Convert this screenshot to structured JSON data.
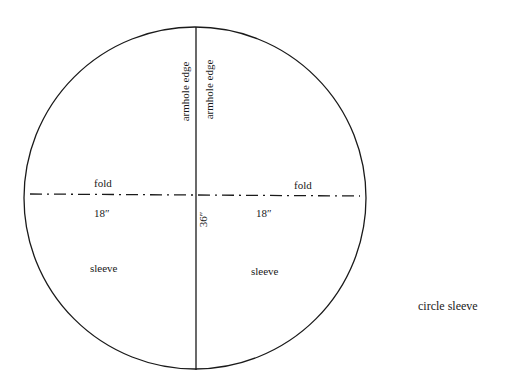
{
  "diagram": {
    "title": "circle sleeve",
    "shape": "circle",
    "circle": {
      "cx": 195,
      "cy": 198,
      "r": 170
    },
    "lines": {
      "fold_line_style": "dash-dot",
      "center_line_style": "solid"
    },
    "labels": {
      "armhole_edge_left": "armhole edge",
      "armhole_edge_right": "armhole edge",
      "fold_left": "fold",
      "fold_right": "fold",
      "radius_left": "18″",
      "radius_right": "18″",
      "diameter": "36″",
      "sleeve_left": "sleeve",
      "sleeve_right": "sleeve",
      "caption": "circle sleeve"
    },
    "colors": {
      "stroke": "#1a1a1a",
      "background": "#ffffff"
    }
  }
}
